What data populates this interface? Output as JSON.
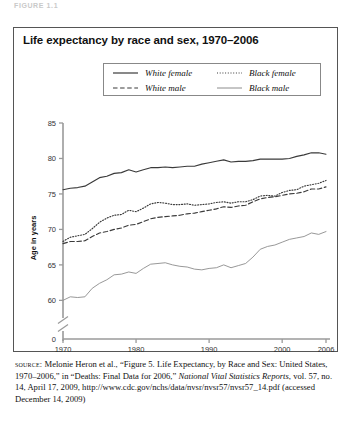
{
  "figure_label": "FIGURE 1.1",
  "chart_title": "Life expectancy by race and sex, 1970–2006",
  "legend": {
    "items": [
      {
        "label": "White female",
        "style": "solid",
        "color": "#3a3a3a",
        "width": 1.2
      },
      {
        "label": "White male",
        "style": "dashed",
        "color": "#3a3a3a",
        "width": 1.2
      },
      {
        "label": "Black female",
        "style": "dotted",
        "color": "#3a3a3a",
        "width": 1.2
      },
      {
        "label": "Black male",
        "style": "thin-solid",
        "color": "#8c8c8c",
        "width": 1.0
      }
    ]
  },
  "source": {
    "kicker": "source:",
    "text_1": " Melonie Heron et al., “Figure 5. Life Expectancy, by Race and Sex: United States, 1970–2006,” in “Deaths: Final Data for 2006,” ",
    "italic_1": "National Vital Statistics Reports",
    "text_2": ", vol. 57, no. 14, April 17, 2009, http://www.cdc.gov/nchs/data/nvsr/nvsr57/nvsr57_14.pdf (accessed December 14, 2009)"
  },
  "chart_data": {
    "type": "line",
    "title": "Life expectancy by race and sex, 1970–2006",
    "xlabel": "",
    "ylabel": "Age in years",
    "xlim": [
      1970,
      2006
    ],
    "ylim": [
      58.5,
      85
    ],
    "y_axis_break": true,
    "y_break_below": 58.5,
    "grid": false,
    "legend_position": "top-center",
    "xticks": [
      1970,
      1980,
      1990,
      2000,
      2006
    ],
    "xtick_labels": [
      "1970",
      "1980",
      "1990",
      "2000",
      "2006"
    ],
    "yticks": [
      0,
      60,
      65,
      70,
      75,
      80,
      85
    ],
    "ytick_labels": [
      "0",
      "60",
      "65",
      "70",
      "75",
      "80",
      "85"
    ],
    "x": [
      1970,
      1971,
      1972,
      1973,
      1974,
      1975,
      1976,
      1977,
      1978,
      1979,
      1980,
      1981,
      1982,
      1983,
      1984,
      1985,
      1986,
      1987,
      1988,
      1989,
      1990,
      1991,
      1992,
      1993,
      1994,
      1995,
      1996,
      1997,
      1998,
      1999,
      2000,
      2001,
      2002,
      2003,
      2004,
      2005,
      2006
    ],
    "series": [
      {
        "name": "White female",
        "style": "solid",
        "color": "#3a3a3a",
        "values": [
          75.6,
          75.8,
          75.9,
          76.1,
          76.7,
          77.3,
          77.5,
          77.9,
          78.0,
          78.4,
          78.1,
          78.4,
          78.7,
          78.7,
          78.8,
          78.7,
          78.8,
          78.9,
          78.9,
          79.2,
          79.4,
          79.6,
          79.8,
          79.5,
          79.6,
          79.6,
          79.7,
          79.9,
          79.9,
          79.9,
          79.9,
          80.0,
          80.3,
          80.5,
          80.8,
          80.8,
          80.6
        ]
      },
      {
        "name": "White male",
        "style": "dashed",
        "color": "#3a3a3a",
        "values": [
          68.0,
          68.3,
          68.3,
          68.4,
          69.0,
          69.5,
          69.7,
          70.0,
          70.2,
          70.6,
          70.7,
          71.1,
          71.5,
          71.7,
          71.8,
          71.9,
          72.0,
          72.2,
          72.3,
          72.5,
          72.7,
          72.9,
          73.2,
          73.1,
          73.3,
          73.4,
          73.9,
          74.3,
          74.5,
          74.6,
          74.8,
          75.0,
          75.1,
          75.3,
          75.7,
          75.7,
          76.0
        ]
      },
      {
        "name": "Black female",
        "style": "dotted",
        "color": "#3a3a3a",
        "values": [
          68.3,
          68.9,
          69.1,
          69.3,
          70.1,
          71.0,
          71.6,
          72.0,
          72.1,
          72.7,
          72.5,
          73.0,
          73.6,
          73.8,
          73.7,
          73.5,
          73.5,
          73.6,
          73.4,
          73.5,
          73.6,
          73.8,
          73.9,
          73.7,
          73.9,
          73.9,
          74.2,
          74.7,
          74.8,
          74.7,
          75.2,
          75.5,
          75.6,
          76.1,
          76.3,
          76.5,
          76.9
        ]
      },
      {
        "name": "Black male",
        "style": "thin-solid",
        "color": "#8c8c8c",
        "values": [
          60.0,
          60.5,
          60.4,
          60.5,
          61.7,
          62.4,
          62.9,
          63.6,
          63.7,
          64.0,
          63.8,
          64.5,
          65.1,
          65.2,
          65.3,
          65.0,
          64.8,
          64.7,
          64.4,
          64.3,
          64.5,
          64.6,
          65.0,
          64.6,
          64.9,
          65.2,
          66.1,
          67.2,
          67.6,
          67.8,
          68.2,
          68.6,
          68.8,
          69.0,
          69.5,
          69.3,
          69.7
        ]
      }
    ]
  }
}
